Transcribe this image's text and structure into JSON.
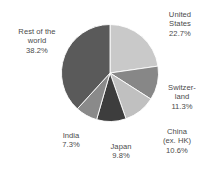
{
  "chart_data": {
    "type": "pie",
    "title": "",
    "subtitle": "",
    "xlabel": "",
    "ylabel": "",
    "legend_position": "none",
    "grid": false,
    "unit": "%",
    "start_angle_deg": 0,
    "direction": "clockwise",
    "categories": [
      "United States",
      "Switzerland",
      "China (ex. HK)",
      "Japan",
      "India",
      "Rest of the world"
    ],
    "values": [
      22.7,
      11.3,
      10.6,
      9.8,
      7.3,
      38.2
    ],
    "slices": [
      {
        "name": "United States",
        "label_lines": [
          "United",
          "States",
          "22.7%"
        ],
        "value": 22.7,
        "value_text": "22.7%",
        "color": "#c9c9c9"
      },
      {
        "name": "Switzerland",
        "label_lines": [
          "Switzer-",
          "land",
          "11.3%"
        ],
        "value": 11.3,
        "value_text": "11.3%",
        "color": "#878787"
      },
      {
        "name": "China (ex. HK)",
        "label_lines": [
          "China",
          "(ex. HK)",
          "10.6%"
        ],
        "value": 10.6,
        "value_text": "10.6%",
        "color": "#c0c0c0"
      },
      {
        "name": "Japan",
        "label_lines": [
          "Japan",
          "9.8%"
        ],
        "value": 9.8,
        "value_text": "9.8%",
        "color": "#3d3d3d"
      },
      {
        "name": "India",
        "label_lines": [
          "India",
          "7.3%"
        ],
        "value": 7.3,
        "value_text": "7.3%",
        "color": "#8a8a8a"
      },
      {
        "name": "Rest of the world",
        "label_lines": [
          "Rest of the",
          "world",
          "38.2%"
        ],
        "value": 38.2,
        "value_text": "38.2%",
        "color": "#5a5a5a"
      }
    ]
  },
  "labels": {
    "united_states": "United\nStates\n22.7%",
    "switzerland": "Switzer-\nland\n11.3%",
    "china": "China\n(ex. HK)\n10.6%",
    "japan": "Japan\n9.8%",
    "india": "India\n7.3%",
    "rest_of_world": "Rest of the\nworld\n38.2%"
  }
}
